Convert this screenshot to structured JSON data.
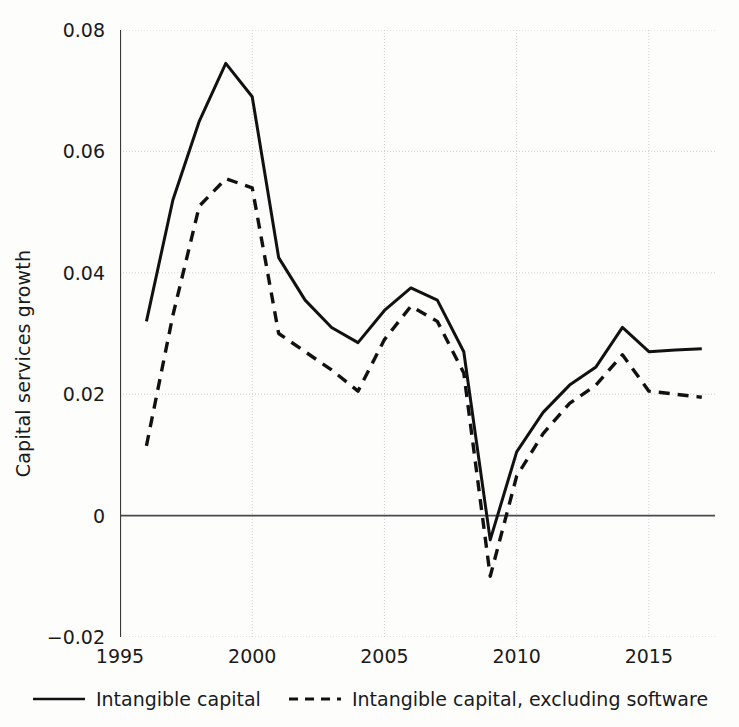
{
  "chart_data": {
    "type": "line",
    "title": "",
    "xlabel": "",
    "ylabel": "Capital services growth",
    "xlim": [
      1995,
      2017.5
    ],
    "ylim": [
      -0.02,
      0.08
    ],
    "xticks": [
      1995,
      2000,
      2005,
      2010,
      2015
    ],
    "yticks": [
      -0.02,
      0,
      0.02,
      0.04,
      0.06,
      0.08
    ],
    "ytick_labels": [
      "−0.02",
      "0",
      "0.02",
      "0.04",
      "0.06",
      "0.08"
    ],
    "xtick_labels": [
      "1995",
      "2000",
      "2005",
      "2010",
      "2015"
    ],
    "grid": true,
    "zero_line": 0,
    "legend_position": "bottom",
    "x": [
      1996,
      1997,
      1998,
      1999,
      2000,
      2001,
      2002,
      2003,
      2004,
      2005,
      2006,
      2007,
      2008,
      2009,
      2010,
      2011,
      2012,
      2013,
      2014,
      2015,
      2016,
      2017
    ],
    "series": [
      {
        "name": "Intangible capital",
        "style": "solid",
        "color": "#111111",
        "values": [
          0.032,
          0.052,
          0.065,
          0.0745,
          0.069,
          0.0425,
          0.0355,
          0.031,
          0.0285,
          0.0338,
          0.0375,
          0.0355,
          0.027,
          -0.004,
          0.0105,
          0.017,
          0.0215,
          0.0245,
          0.031,
          0.027,
          0.0273,
          0.0275
        ]
      },
      {
        "name": "Intangible capital, excluding software",
        "style": "dashed",
        "color": "#111111",
        "values": [
          0.0115,
          0.033,
          0.051,
          0.0555,
          0.054,
          0.03,
          0.027,
          0.024,
          0.0205,
          0.029,
          0.0345,
          0.032,
          0.0235,
          -0.01,
          0.0065,
          0.0135,
          0.0185,
          0.0215,
          0.0265,
          0.0205,
          0.02,
          0.0195
        ]
      }
    ]
  },
  "legend": {
    "items": [
      {
        "label": "Intangible capital",
        "style": "solid"
      },
      {
        "label": "Intangible capital, excluding software",
        "style": "dashed"
      }
    ]
  }
}
